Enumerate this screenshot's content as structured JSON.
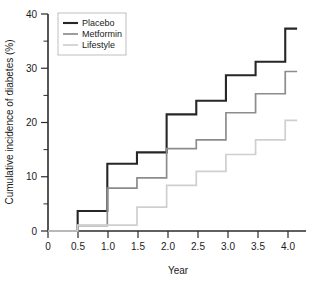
{
  "chart_data": {
    "type": "line",
    "subtype": "step",
    "title": "",
    "xlabel": "Year",
    "ylabel": "Cumulative incidence of diabetes (%)",
    "xlim": [
      0,
      4.35
    ],
    "ylim": [
      0,
      40
    ],
    "xticks": [
      0,
      0.5,
      1.0,
      1.5,
      2.0,
      2.5,
      3.0,
      3.5,
      4.0
    ],
    "xtick_labels": [
      "0",
      "0.5",
      "1.0",
      "1.5",
      "2.0",
      "2.5",
      "3.0",
      "3.5",
      "4.0"
    ],
    "yticks": [
      0,
      10,
      20,
      30,
      40
    ],
    "ytick_labels": [
      "0",
      "10",
      "20",
      "30",
      "40"
    ],
    "yticks_minor": [
      5,
      15,
      25,
      35
    ],
    "grid": false,
    "legend_position": "upper left",
    "x": [
      0,
      0.5,
      1.0,
      1.5,
      2.0,
      2.5,
      3.0,
      3.5,
      4.0,
      4.2
    ],
    "series": [
      {
        "name": "Placebo",
        "color": "#262626",
        "linewidth": 2.1,
        "values": [
          0,
          3.7,
          12.4,
          14.5,
          21.5,
          24.0,
          28.7,
          31.2,
          37.3,
          37.3
        ]
      },
      {
        "name": "Metformin",
        "color": "#8c8c8c",
        "linewidth": 1.7,
        "values": [
          0,
          1.0,
          7.9,
          9.8,
          15.2,
          16.8,
          21.8,
          25.3,
          29.4,
          29.4
        ]
      },
      {
        "name": "Lifestyle",
        "color": "#cfcfcf",
        "linewidth": 1.7,
        "values": [
          0,
          1.1,
          1.1,
          4.4,
          8.4,
          11.0,
          14.1,
          16.8,
          20.4,
          20.4
        ]
      }
    ]
  },
  "legend": {
    "entries": [
      {
        "label": "Placebo"
      },
      {
        "label": "Metformin"
      },
      {
        "label": "Lifestyle"
      }
    ]
  }
}
